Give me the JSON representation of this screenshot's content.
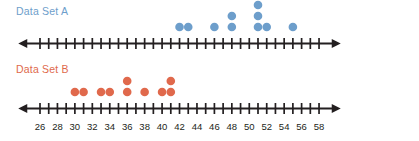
{
  "chart_data": {
    "type": "scatter",
    "title": "",
    "subtitle": "",
    "xlabel": "",
    "ylabel": "",
    "xlim": [
      25,
      59
    ],
    "grid": false,
    "legend_position": "above-each-plot",
    "plots": [
      {
        "name": "Data Set A",
        "label": "Data Set A",
        "color": "#6d9ecb",
        "axis": {
          "min": 25,
          "max": 59,
          "tick_step": 1,
          "label_step": 2,
          "labels_visible": false,
          "left_arrow": true,
          "right_arrow": true
        },
        "values": [
          42,
          43,
          46,
          48,
          48,
          51,
          51,
          51,
          52,
          55
        ],
        "stacks": [
          {
            "x": 42,
            "count": 1
          },
          {
            "x": 43,
            "count": 1
          },
          {
            "x": 46,
            "count": 1
          },
          {
            "x": 48,
            "count": 2
          },
          {
            "x": 51,
            "count": 3
          },
          {
            "x": 52,
            "count": 1
          },
          {
            "x": 55,
            "count": 1
          }
        ]
      },
      {
        "name": "Data Set B",
        "label": "Data Set B",
        "color": "#e0694c",
        "axis": {
          "min": 25,
          "max": 59,
          "tick_step": 1,
          "label_step": 2,
          "labels_visible": true,
          "left_arrow": true,
          "right_arrow": true
        },
        "values": [
          30,
          31,
          33,
          34,
          36,
          36,
          38,
          40,
          41,
          41
        ],
        "stacks": [
          {
            "x": 30,
            "count": 1
          },
          {
            "x": 31,
            "count": 1
          },
          {
            "x": 33,
            "count": 1
          },
          {
            "x": 34,
            "count": 1
          },
          {
            "x": 36,
            "count": 2
          },
          {
            "x": 38,
            "count": 1
          },
          {
            "x": 40,
            "count": 1
          },
          {
            "x": 41,
            "count": 2
          }
        ]
      }
    ],
    "tick_labels": [
      26,
      28,
      30,
      32,
      34,
      36,
      38,
      40,
      42,
      44,
      46,
      48,
      50,
      52,
      54,
      56,
      58
    ]
  },
  "colors": {
    "series_a": "#6d9ecb",
    "series_b": "#e0694c",
    "axis": "#231f20",
    "tick_label": "#231f20",
    "background": "#ffffff"
  },
  "labels": {
    "data_set_a": "Data Set A",
    "data_set_b": "Data Set B"
  }
}
